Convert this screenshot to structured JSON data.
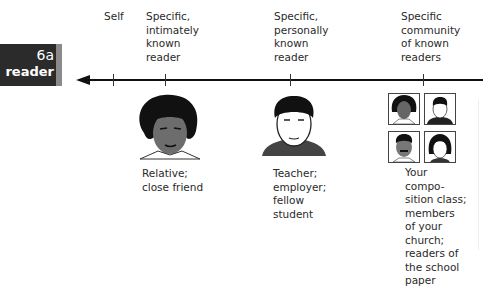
{
  "tab": {
    "number": "6a",
    "word": "reader",
    "bg_color": "#2b2b2b",
    "notch_color": "#8a8a8a"
  },
  "scale": {
    "direction": "left-arrow",
    "points": [
      {
        "label": "Self",
        "tick_x": 113
      },
      {
        "label": "Specific,\nintimately\nknown\nreader",
        "tick_x": 165
      },
      {
        "label": "Specific,\npersonally\nknown\nreader",
        "tick_x": 290
      },
      {
        "label": "Specific\ncommunity\nof known\nreaders",
        "tick_x": 423
      }
    ]
  },
  "examples": [
    {
      "figure": "single-portrait-relative",
      "caption": "Relative;\nclose friend"
    },
    {
      "figure": "single-portrait-teacher",
      "caption": "Teacher;\nemployer;\nfellow\nstudent"
    },
    {
      "figure": "four-portrait-grid",
      "caption": "Your\ncompo-\nsition class;\nmembers\nof your\nchurch;\nreaders of\nthe school\npaper"
    }
  ]
}
